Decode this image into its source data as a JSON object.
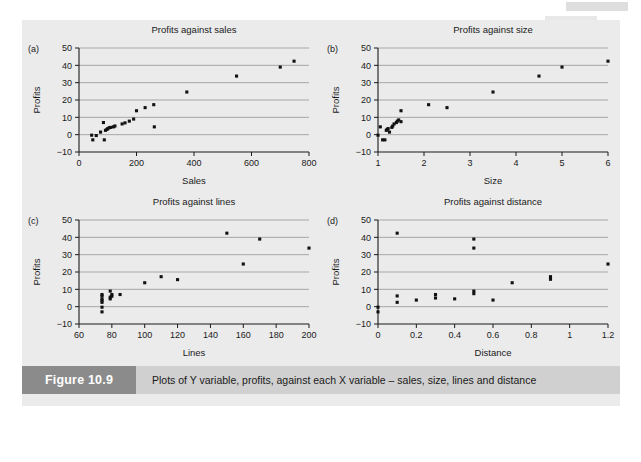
{
  "figure": {
    "tag_label": "Figure 10.9",
    "caption": "Plots of Y variable, profits, against each X variable – sales, size, lines and distance",
    "background_color": "#ebebeb",
    "tag_color": "#8b8b8b",
    "caption_bg_color": "#d0d0d0"
  },
  "chart_data": [
    {
      "panel": "(a)",
      "type": "scatter",
      "title": "Profits against sales",
      "xlabel": "Sales",
      "ylabel": "Profits",
      "xlim": [
        0,
        800
      ],
      "ylim": [
        -10,
        50
      ],
      "xticks": [
        0,
        200,
        400,
        600,
        800
      ],
      "yticks": [
        -10,
        0,
        10,
        20,
        30,
        40,
        50
      ],
      "xticklabels": [
        "0",
        "200",
        "400",
        "600",
        "800"
      ],
      "yticklabels": [
        "−10",
        "0",
        "10",
        "20",
        "30",
        "40",
        "50"
      ],
      "grid": "horizontal",
      "marker": "square",
      "marker_color": "#111111",
      "x": [
        44,
        48,
        60,
        75,
        85,
        88,
        92,
        97,
        100,
        105,
        110,
        120,
        125,
        150,
        160,
        175,
        190,
        200,
        230,
        260,
        262,
        375,
        548,
        700,
        748
      ],
      "y": [
        -0.3,
        -3.0,
        -0.5,
        1.5,
        7.0,
        -3.0,
        2.5,
        3.0,
        3.5,
        4.0,
        4.2,
        4.5,
        5.0,
        6.2,
        6.8,
        7.8,
        9.0,
        13.8,
        15.6,
        17.3,
        4.5,
        24.6,
        33.8,
        39.0,
        42.4
      ]
    },
    {
      "panel": "(b)",
      "type": "scatter",
      "title": "Profits against size",
      "xlabel": "Size",
      "ylabel": "Profits",
      "xlim": [
        1,
        6
      ],
      "ylim": [
        -10,
        50
      ],
      "xticks": [
        1,
        2,
        3,
        4,
        5,
        6
      ],
      "yticks": [
        -10,
        0,
        10,
        20,
        30,
        40,
        50
      ],
      "xticklabels": [
        "1",
        "2",
        "3",
        "4",
        "5",
        "6"
      ],
      "yticklabels": [
        "−10",
        "0",
        "10",
        "20",
        "30",
        "40",
        "50"
      ],
      "grid": "horizontal",
      "marker": "square",
      "marker_color": "#111111",
      "x": [
        1.0,
        1.05,
        1.1,
        1.15,
        1.18,
        1.2,
        1.22,
        1.25,
        1.3,
        1.32,
        1.35,
        1.4,
        1.42,
        1.45,
        1.5,
        1.5,
        2.1,
        2.5,
        3.5,
        4.5,
        5.0,
        6.0
      ],
      "y": [
        -0.3,
        4.5,
        -3.0,
        -3.0,
        2.5,
        3.0,
        3.5,
        1.5,
        4.2,
        5.0,
        6.2,
        7.0,
        7.8,
        8.5,
        7.5,
        13.8,
        17.3,
        15.6,
        24.6,
        33.8,
        39.0,
        42.4
      ]
    },
    {
      "panel": "(c)",
      "type": "scatter",
      "title": "Profits against lines",
      "xlabel": "Lines",
      "ylabel": "Profits",
      "xlim": [
        60,
        200
      ],
      "ylim": [
        -10,
        50
      ],
      "xticks": [
        60,
        80,
        100,
        120,
        140,
        160,
        180,
        200
      ],
      "yticks": [
        -10,
        0,
        10,
        20,
        30,
        40,
        50
      ],
      "xticklabels": [
        "60",
        "80",
        "100",
        "120",
        "140",
        "160",
        "180",
        "200"
      ],
      "yticklabels": [
        "−10",
        "0",
        "10",
        "20",
        "30",
        "40",
        "50"
      ],
      "grid": "horizontal",
      "marker": "square",
      "marker_color": "#111111",
      "x": [
        74,
        74,
        74,
        74,
        74,
        74,
        74,
        79,
        79,
        79,
        80,
        80,
        85,
        100,
        110,
        120,
        150,
        160,
        170,
        200
      ],
      "y": [
        -3.0,
        -0.3,
        2.5,
        3.5,
        4.5,
        6.2,
        7.0,
        4.5,
        5.5,
        9.0,
        7.0,
        6.0,
        7.0,
        13.8,
        17.3,
        15.6,
        42.4,
        24.6,
        39.0,
        33.8
      ]
    },
    {
      "panel": "(d)",
      "type": "scatter",
      "title": "Profits against distance",
      "xlabel": "Distance",
      "ylabel": "Profits",
      "xlim": [
        0,
        1.2
      ],
      "ylim": [
        -10,
        50
      ],
      "xticks": [
        0,
        0.2,
        0.4,
        0.6,
        0.8,
        1.0,
        1.2
      ],
      "yticks": [
        -10,
        0,
        10,
        20,
        30,
        40,
        50
      ],
      "xticklabels": [
        "0",
        "0.2",
        "0.4",
        "0.6",
        "0.8",
        "1",
        "1.2"
      ],
      "yticklabels": [
        "−10",
        "0",
        "10",
        "20",
        "30",
        "40",
        "50"
      ],
      "grid": "horizontal",
      "marker": "square",
      "marker_color": "#111111",
      "x": [
        0.0,
        0.0,
        0.1,
        0.1,
        0.1,
        0.2,
        0.3,
        0.3,
        0.4,
        0.5,
        0.5,
        0.5,
        0.5,
        0.6,
        0.7,
        0.9,
        0.9,
        1.2
      ],
      "y": [
        -0.3,
        -3.0,
        42.4,
        6.2,
        2.5,
        3.8,
        7.0,
        5.0,
        4.5,
        39.0,
        33.8,
        9.0,
        7.5,
        3.8,
        13.8,
        17.3,
        15.8,
        24.6
      ]
    }
  ]
}
